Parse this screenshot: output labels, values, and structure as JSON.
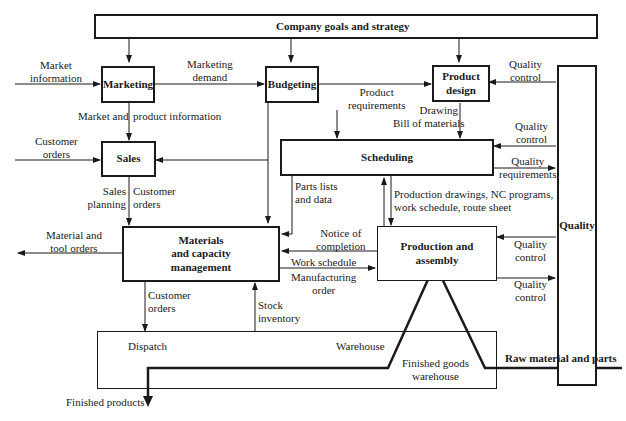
{
  "diagram": {
    "nodes": {
      "company_goals": "Company goals and strategy",
      "marketing": "Marketing",
      "budgeting": "Budgeting",
      "product_design_1": "Product",
      "product_design_2": "design",
      "sales": "Sales",
      "scheduling": "Scheduling",
      "materials_1": "Materials",
      "materials_2": "and capacity",
      "materials_3": "management",
      "production": "Production and assembly",
      "quality": "Quality",
      "dispatch": "Dispatch",
      "warehouse": "Warehouse",
      "finished_goods_1": "Finished goods",
      "finished_goods_2": "warehouse"
    },
    "edge_labels": {
      "market_information_1": "Market",
      "market_information_2": "information",
      "marketing_demand_1": "Marketing",
      "marketing_demand_2": "demand",
      "product_requirements_1": "Product",
      "product_requirements_2": "requirements",
      "drawing": "Drawing",
      "bill_of_materials": "Bill of materials",
      "quality_control_pd_1": "Quality",
      "quality_control_pd_2": "control",
      "market_product_info_a": "Market and",
      "market_product_info_b": "product information",
      "customer_orders_in_1": "Customer",
      "customer_orders_in_2": "orders",
      "quality_control_sched_1": "Quality",
      "quality_control_sched_2": "control",
      "quality_requirements_1": "Quality",
      "quality_requirements_2": "requirements",
      "sales_planning_1": "Sales",
      "sales_planning_2": "planning",
      "customer_orders_sales_1": "Customer",
      "customer_orders_sales_2": "orders",
      "parts_lists_1": "Parts lists",
      "parts_lists_2": "and data",
      "production_drawings_1": "Production drawings, NC programs,",
      "production_drawings_2": "work schedule, route sheet",
      "material_tool_orders_1": "Material and",
      "material_tool_orders_2": "tool orders",
      "notice_completion_1": "Notice of",
      "notice_completion_2": "completion",
      "work_schedule": "Work schedule",
      "manufacturing_order_1": "Manufacturing",
      "manufacturing_order_2": "order",
      "quality_control_prod_in_1": "Quality",
      "quality_control_prod_in_2": "control",
      "quality_control_prod_out_1": "Quality",
      "quality_control_prod_out_2": "control",
      "customer_orders_dispatch_1": "Customer",
      "customer_orders_dispatch_2": "orders",
      "stock_inventory_1": "Stock",
      "stock_inventory_2": "inventory",
      "raw_material": "Raw material and parts",
      "finished_products": "Finished products"
    }
  }
}
